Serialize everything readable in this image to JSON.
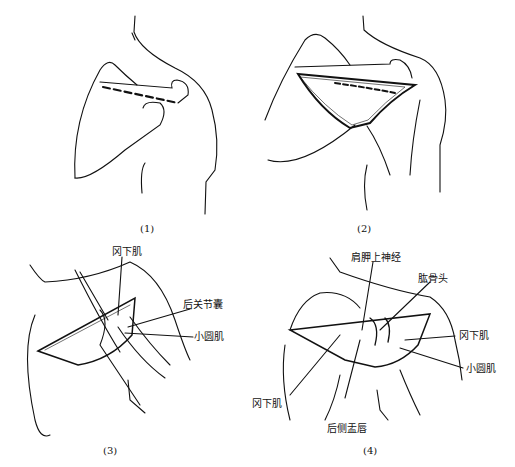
{
  "figure": {
    "panels": [
      {
        "id": 1,
        "caption": "(1)",
        "labels": []
      },
      {
        "id": 2,
        "caption": "(2)",
        "labels": []
      },
      {
        "id": 3,
        "caption": "(3)",
        "labels": [
          "冈下肌",
          "后关节囊",
          "小圆肌"
        ]
      },
      {
        "id": 4,
        "caption": "(4)",
        "labels": [
          "肩胛上神经",
          "肱骨头",
          "冈下肌",
          "小圆肌",
          "冈下肌",
          "后侧盂唇"
        ]
      }
    ]
  }
}
